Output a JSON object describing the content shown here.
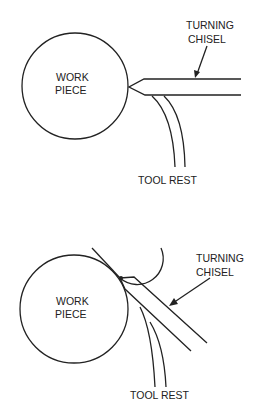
{
  "diagrams": [
    {
      "id": "top",
      "labels": {
        "workpiece_line1": "WORK",
        "workpiece_line2": "PIECE",
        "chisel_line1": "TURNING",
        "chisel_line2": "CHISEL",
        "toolrest": "TOOL REST"
      }
    },
    {
      "id": "bottom",
      "labels": {
        "workpiece_line1": "WORK",
        "workpiece_line2": "PIECE",
        "chisel_line1": "TURNING",
        "chisel_line2": "CHISEL",
        "toolrest": "TOOL REST"
      }
    }
  ],
  "colors": {
    "line": "#222222",
    "background": "#ffffff"
  }
}
